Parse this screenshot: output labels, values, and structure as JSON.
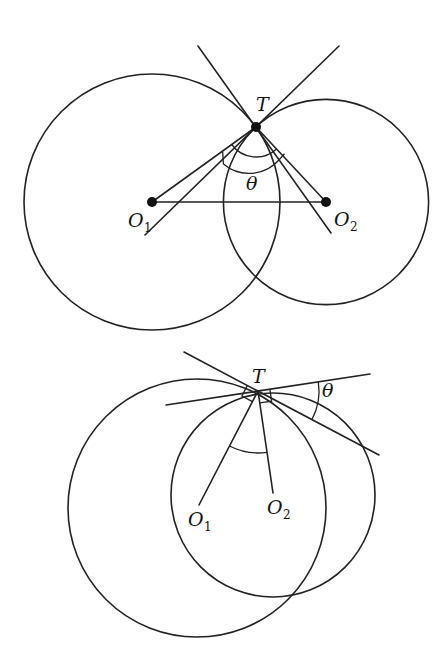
{
  "figure": {
    "colors": {
      "ink": "#222222",
      "background": "#ffffff"
    }
  },
  "top_diagram": {
    "labels": {
      "T": "T",
      "theta": "θ",
      "O1_main": "O",
      "O1_sub": "1",
      "O2_main": "O",
      "O2_sub": "2"
    },
    "points": {
      "T": [
        256,
        127
      ],
      "O1": [
        152,
        202
      ],
      "O2": [
        326,
        202
      ]
    },
    "circles": [
      {
        "name": "circle-1",
        "center": [
          152,
          202
        ],
        "radius": 128
      },
      {
        "name": "circle-2",
        "center": [
          326,
          202
        ],
        "radius": 102.6
      }
    ]
  },
  "bottom_diagram": {
    "labels": {
      "T": "T",
      "theta": "θ",
      "O1_main": "O",
      "O1_sub": "1",
      "O2_main": "O",
      "O2_sub": "2"
    },
    "points": {
      "T": [
        258,
        391
      ],
      "O1": [
        199,
        506
      ],
      "O2": [
        273,
        494
      ]
    },
    "circles": [
      {
        "name": "circle-1",
        "center": [
          197,
          508
        ],
        "radius": 129
      },
      {
        "name": "circle-2",
        "center": [
          273,
          495
        ],
        "radius": 102
      }
    ]
  }
}
